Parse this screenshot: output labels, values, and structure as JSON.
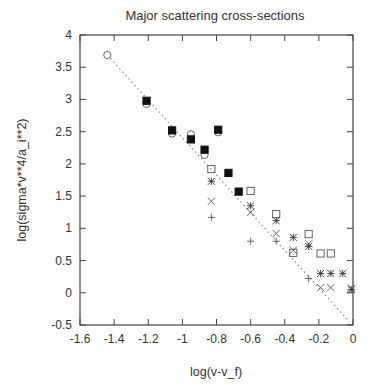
{
  "chart_data": {
    "type": "scatter",
    "title": "Major scattering cross-sections",
    "xlabel": "log(v-v_f)",
    "ylabel": "log(sigma*v**4/a_i**2)",
    "xlim": [
      -1.6,
      0
    ],
    "ylim": [
      -0.5,
      4
    ],
    "xticks": [
      -1.6,
      -1.4,
      -1.2,
      -1,
      -0.8,
      -0.6,
      -0.4,
      -0.2,
      0
    ],
    "xtick_labels": [
      "-1.6",
      "-1.4",
      "-1.2",
      "-1",
      "-0.8",
      "-0.6",
      "-0.4",
      "-0.2",
      "0"
    ],
    "yticks": [
      -0.5,
      0,
      0.5,
      1,
      1.5,
      2,
      2.5,
      3,
      3.5,
      4
    ],
    "ytick_labels": [
      "-0.5",
      "0",
      "0.5",
      "1",
      "1.5",
      "2",
      "2.5",
      "3",
      "3.5",
      "4"
    ],
    "grid": false,
    "legend": null,
    "series": [
      {
        "name": "open circle",
        "marker": "circle-open",
        "points": [
          [
            -1.44,
            3.69
          ],
          [
            -1.21,
            2.93
          ],
          [
            -1.06,
            2.47
          ],
          [
            -0.95,
            2.46
          ],
          [
            -0.87,
            2.14
          ],
          [
            -0.79,
            2.49
          ]
        ]
      },
      {
        "name": "filled square",
        "marker": "square-filled",
        "points": [
          [
            -1.21,
            2.98
          ],
          [
            -1.06,
            2.52
          ],
          [
            -0.95,
            2.38
          ],
          [
            -0.87,
            2.22
          ],
          [
            -0.79,
            2.53
          ],
          [
            -0.73,
            1.86
          ],
          [
            -0.67,
            1.57
          ]
        ]
      },
      {
        "name": "open square",
        "marker": "square-open",
        "points": [
          [
            -0.83,
            1.92
          ],
          [
            -0.6,
            1.58
          ],
          [
            -0.45,
            1.22
          ],
          [
            -0.35,
            0.62
          ],
          [
            -0.26,
            0.91
          ],
          [
            -0.19,
            0.61
          ],
          [
            -0.13,
            0.61
          ]
        ]
      },
      {
        "name": "asterisk",
        "marker": "asterisk",
        "points": [
          [
            -0.83,
            1.73
          ],
          [
            -0.6,
            1.35
          ],
          [
            -0.45,
            1.12
          ],
          [
            -0.35,
            0.86
          ],
          [
            -0.26,
            0.72
          ],
          [
            -0.19,
            0.3
          ],
          [
            -0.13,
            0.3
          ],
          [
            -0.06,
            0.3
          ],
          [
            -0.01,
            0.05
          ]
        ]
      },
      {
        "name": "cross",
        "marker": "x",
        "points": [
          [
            -0.83,
            1.42
          ],
          [
            -0.6,
            1.25
          ],
          [
            -0.45,
            0.92
          ],
          [
            -0.35,
            0.66
          ],
          [
            -0.26,
            0.76
          ],
          [
            -0.19,
            0.08
          ],
          [
            -0.13,
            0.08
          ],
          [
            -0.01,
            0.07
          ]
        ]
      },
      {
        "name": "plus",
        "marker": "plus",
        "points": [
          [
            -0.83,
            1.17
          ],
          [
            -0.6,
            0.8
          ],
          [
            -0.45,
            0.8
          ],
          [
            -0.26,
            0.22
          ]
        ]
      }
    ],
    "fit_line": {
      "style": "dotted",
      "x": [
        -1.44,
        -0.02
      ],
      "y": [
        3.69,
        -0.45
      ]
    }
  }
}
